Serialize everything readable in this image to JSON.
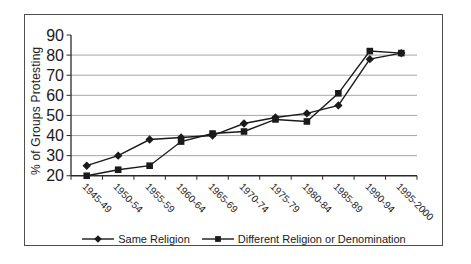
{
  "figure": {
    "background": "#ffffff",
    "frame_border_color": "#4f4f4f",
    "text_color": "#1a1a1a"
  },
  "chart_data": {
    "type": "line",
    "title": "",
    "xlabel": "",
    "ylabel": "% of Groups Protesting",
    "categories": [
      "1945-49",
      "1950-54",
      "1955-59",
      "1960-64",
      "1965-69",
      "1970-74",
      "1975-79",
      "1980-84",
      "1985-89",
      "1990-94",
      "1995-2000"
    ],
    "series": [
      {
        "name": "Same Religion",
        "marker": "diamond",
        "values": [
          25,
          30,
          38,
          39,
          40,
          46,
          49,
          51,
          55,
          78,
          81
        ]
      },
      {
        "name": "Different Religion or Denomination",
        "marker": "square",
        "values": [
          20,
          23,
          25,
          37,
          41,
          42,
          48,
          47,
          61,
          82,
          81
        ]
      }
    ],
    "ylim": [
      20,
      90
    ],
    "ytick_step": 10,
    "grid": "horizontal-only",
    "legend_position": "bottom",
    "line_color": "#1a1a1a",
    "axis_color": "#2a2a2a",
    "grid_color": "#9c9c9c"
  }
}
